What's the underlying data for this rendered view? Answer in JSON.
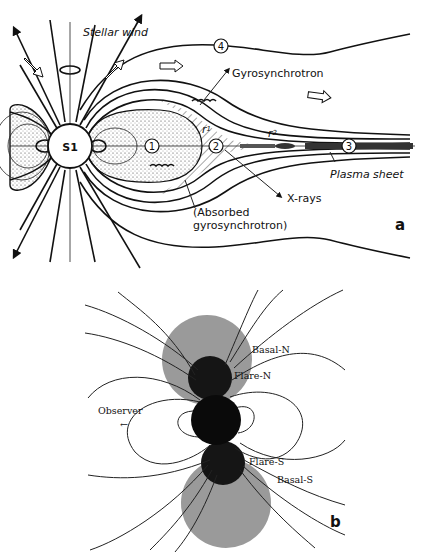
{
  "panel_a": {
    "label": "a",
    "star": "S1",
    "labels": {
      "stellar_wind": "Stellar wind",
      "gyrosynchrotron": "Gyrosynchrotron",
      "plasma_sheet": "Plasma sheet",
      "x_rays": "X-rays",
      "absorbed_1": "(Absorbed",
      "absorbed_2": "gyrosynchrotron)",
      "r1": "r",
      "r1_sub": "1",
      "r2": "r",
      "r2_sub": "2"
    },
    "regions": [
      "1",
      "2",
      "3",
      "4"
    ]
  },
  "panel_b": {
    "label": "b",
    "labels": {
      "basal_n": "Basal-N",
      "flare_n": "Flare-N",
      "observer": "Observer",
      "observer_arrow": "←",
      "flare_s": "Flare-S",
      "basal_s": "Basal-S"
    },
    "colors": {
      "basal": "#9a9a9a",
      "flare": "#151515",
      "star": "#0a0a0a"
    }
  }
}
